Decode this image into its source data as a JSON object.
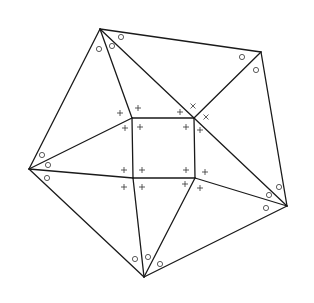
{
  "diagram": {
    "title": "",
    "colors": {
      "line": "#1a1a1a",
      "marker": "#333333",
      "background": "#ffffff"
    },
    "vertices": {
      "A": [
        100,
        29
      ],
      "B": [
        261,
        52
      ],
      "C": [
        29,
        169
      ],
      "D": [
        287,
        206
      ],
      "E": [
        144,
        277
      ],
      "P": [
        132,
        118
      ],
      "Q": [
        194,
        118
      ],
      "R": [
        195,
        178
      ],
      "S": [
        133,
        178
      ]
    },
    "edges": [
      [
        "A",
        "B"
      ],
      [
        "B",
        "D"
      ],
      [
        "D",
        "E"
      ],
      [
        "E",
        "C"
      ],
      [
        "C",
        "A"
      ],
      [
        "P",
        "Q"
      ],
      [
        "Q",
        "R"
      ],
      [
        "R",
        "S"
      ],
      [
        "S",
        "P"
      ],
      [
        "A",
        "P"
      ],
      [
        "A",
        "Q"
      ],
      [
        "B",
        "Q"
      ],
      [
        "C",
        "P"
      ],
      [
        "C",
        "S"
      ],
      [
        "D",
        "Q"
      ],
      [
        "D",
        "R"
      ],
      [
        "E",
        "S"
      ],
      [
        "E",
        "R"
      ]
    ],
    "circle_markers": [
      [
        99,
        49
      ],
      [
        112,
        46
      ],
      [
        121,
        37
      ],
      [
        242,
        57
      ],
      [
        256,
        70
      ],
      [
        42,
        155
      ],
      [
        48,
        165
      ],
      [
        47,
        178
      ],
      [
        279,
        187
      ],
      [
        269,
        195
      ],
      [
        266,
        208
      ],
      [
        135,
        259
      ],
      [
        148,
        257
      ],
      [
        160,
        264
      ]
    ],
    "plus_markers": [
      [
        120,
        113
      ],
      [
        138,
        108
      ],
      [
        125,
        128
      ],
      [
        140,
        127
      ],
      [
        180,
        112
      ],
      [
        186,
        127
      ],
      [
        200,
        130
      ],
      [
        124,
        170
      ],
      [
        142,
        170
      ],
      [
        124,
        187
      ],
      [
        142,
        187
      ],
      [
        186,
        170
      ],
      [
        205,
        172
      ],
      [
        185,
        184
      ],
      [
        200,
        188
      ]
    ],
    "x_markers": [
      [
        193,
        106
      ],
      [
        206,
        117
      ]
    ]
  }
}
